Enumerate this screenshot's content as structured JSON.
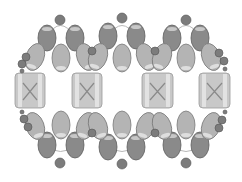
{
  "diagram": {
    "colors": {
      "background": "#ffffff",
      "thread": "#b8b8b8",
      "dark_drop_fill": "#8a8a8a",
      "dark_drop_stroke": "#5e5e5e",
      "light_drop_fill": "#b4b4b4",
      "light_drop_stroke": "#7a7a7a",
      "round_bead_fill": "#7c7c7c",
      "round_bead_stroke": "#555555",
      "cube_fill": "#c8c8c8",
      "cube_stripe": "#e2e2e2",
      "cube_stroke": "#9a9a9a",
      "cube_x": "#8a8a8a",
      "highlight": "#f0f0f0"
    },
    "cubes": [
      {
        "x": 15,
        "y": 73,
        "w": 30,
        "h": 35
      },
      {
        "x": 72,
        "y": 73,
        "w": 30,
        "h": 35
      },
      {
        "x": 142,
        "y": 73,
        "w": 31,
        "h": 35
      },
      {
        "x": 199,
        "y": 73,
        "w": 31,
        "h": 35
      }
    ],
    "dark_drops": [
      {
        "cx": 47,
        "cy": 38
      },
      {
        "cx": 75,
        "cy": 38
      },
      {
        "cx": 108,
        "cy": 36
      },
      {
        "cx": 136,
        "cy": 36
      },
      {
        "cx": 172,
        "cy": 38
      },
      {
        "cx": 200,
        "cy": 38
      },
      {
        "cx": 47,
        "cy": 145
      },
      {
        "cx": 75,
        "cy": 145
      },
      {
        "cx": 108,
        "cy": 147
      },
      {
        "cx": 136,
        "cy": 147
      },
      {
        "cx": 172,
        "cy": 145
      },
      {
        "cx": 200,
        "cy": 145
      }
    ],
    "light_drops": [
      {
        "cx": 35,
        "cy": 57,
        "rot": 20
      },
      {
        "cx": 61,
        "cy": 58,
        "rot": 0
      },
      {
        "cx": 86,
        "cy": 57,
        "rot": -20
      },
      {
        "cx": 98,
        "cy": 57,
        "rot": 20
      },
      {
        "cx": 122,
        "cy": 58,
        "rot": 0
      },
      {
        "cx": 146,
        "cy": 57,
        "rot": -20
      },
      {
        "cx": 162,
        "cy": 57,
        "rot": 20
      },
      {
        "cx": 186,
        "cy": 58,
        "rot": 0
      },
      {
        "cx": 211,
        "cy": 57,
        "rot": -20
      },
      {
        "cx": 35,
        "cy": 126,
        "rot": -20
      },
      {
        "cx": 61,
        "cy": 125,
        "rot": 0
      },
      {
        "cx": 86,
        "cy": 126,
        "rot": 20
      },
      {
        "cx": 98,
        "cy": 126,
        "rot": -20
      },
      {
        "cx": 122,
        "cy": 125,
        "rot": 0
      },
      {
        "cx": 146,
        "cy": 126,
        "rot": 20
      },
      {
        "cx": 162,
        "cy": 126,
        "rot": -20
      },
      {
        "cx": 186,
        "cy": 125,
        "rot": 0
      },
      {
        "cx": 211,
        "cy": 126,
        "rot": 20
      }
    ],
    "round_beads": [
      {
        "cx": 60,
        "cy": 20,
        "r": 5
      },
      {
        "cx": 122,
        "cy": 18,
        "r": 5
      },
      {
        "cx": 186,
        "cy": 20,
        "r": 5
      },
      {
        "cx": 92,
        "cy": 51,
        "r": 4
      },
      {
        "cx": 155,
        "cy": 51,
        "r": 4
      },
      {
        "cx": 26,
        "cy": 57,
        "r": 4
      },
      {
        "cx": 22,
        "cy": 64,
        "r": 4
      },
      {
        "cx": 22,
        "cy": 71,
        "r": 2
      },
      {
        "cx": 219,
        "cy": 53,
        "r": 4
      },
      {
        "cx": 224,
        "cy": 61,
        "r": 4
      },
      {
        "cx": 225,
        "cy": 69,
        "r": 2
      },
      {
        "cx": 60,
        "cy": 163,
        "r": 5
      },
      {
        "cx": 122,
        "cy": 164,
        "r": 5
      },
      {
        "cx": 186,
        "cy": 163,
        "r": 5
      },
      {
        "cx": 92,
        "cy": 133,
        "r": 4
      },
      {
        "cx": 155,
        "cy": 133,
        "r": 4
      },
      {
        "cx": 22,
        "cy": 112,
        "r": 2
      },
      {
        "cx": 24,
        "cy": 119,
        "r": 4
      },
      {
        "cx": 28,
        "cy": 127,
        "r": 4
      },
      {
        "cx": 225,
        "cy": 112,
        "r": 2
      },
      {
        "cx": 222,
        "cy": 120,
        "r": 4
      },
      {
        "cx": 219,
        "cy": 128,
        "r": 4
      }
    ]
  }
}
